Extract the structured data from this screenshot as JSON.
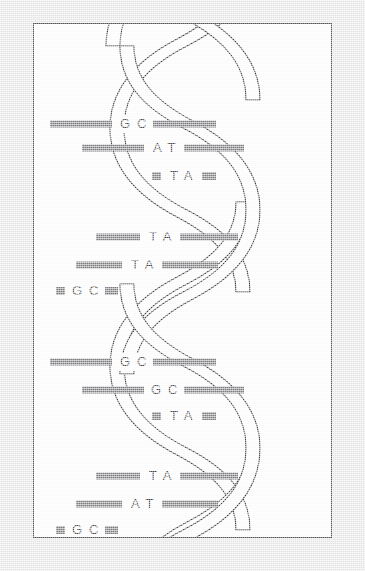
{
  "figure": {
    "name": "dna-double-helix",
    "title": "DNA Double Helix",
    "background_color": "#e9e9e9",
    "frame_color": "#58585c",
    "frame_fill": "#ffffff",
    "strand_stroke_color": "#3d3d42",
    "rung_color": "#7e7e82",
    "label_color": "#4a4a4e"
  },
  "helix": {
    "turns": 4,
    "base_pairs_per_turn": 3,
    "total_base_pairs": 12,
    "left_edge_x": 113,
    "right_edge_x": 256,
    "turn_height": 118
  },
  "base_pairs": [
    {
      "id": "bp-1",
      "turn": 1,
      "index": 1,
      "label": "G C",
      "left_base": "G",
      "right_base": "C",
      "cy": 100,
      "bar_left_x": 16,
      "bar_left_w": 62,
      "bar_right_x": 119,
      "bar_right_w": 63,
      "label_x": 100
    },
    {
      "id": "bp-2",
      "turn": 1,
      "index": 2,
      "label": "A T",
      "left_base": "A",
      "right_base": "T",
      "cy": 124,
      "bar_left_x": 48,
      "bar_left_w": 62,
      "bar_right_x": 150,
      "bar_right_w": 60,
      "label_x": 131
    },
    {
      "id": "bp-3",
      "turn": 1,
      "index": 3,
      "label": "T A",
      "left_base": "T",
      "right_base": "A",
      "cy": 152,
      "bar_left_x": 118,
      "bar_left_w": 9,
      "bar_right_x": 168,
      "bar_right_w": 14,
      "label_x": 148
    },
    {
      "id": "bp-4",
      "turn": 2,
      "index": 1,
      "label": "T A",
      "left_base": "T",
      "right_base": "A",
      "cy": 213,
      "bar_left_x": 62,
      "bar_left_w": 44,
      "bar_right_x": 146,
      "bar_right_w": 58,
      "label_x": 127
    },
    {
      "id": "bp-5",
      "turn": 2,
      "index": 2,
      "label": "T A",
      "left_base": "T",
      "right_base": "A",
      "cy": 241,
      "bar_left_x": 42,
      "bar_left_w": 46,
      "bar_right_x": 128,
      "bar_right_w": 56,
      "label_x": 109
    },
    {
      "id": "bp-6",
      "turn": 2,
      "index": 3,
      "label": "G C",
      "left_base": "G",
      "right_base": "C",
      "cy": 267,
      "bar_left_x": 22,
      "bar_left_w": 9,
      "bar_right_x": 71,
      "bar_right_w": 13,
      "label_x": 52
    },
    {
      "id": "bp-7",
      "turn": 3,
      "index": 1,
      "label": "G C",
      "left_base": "G",
      "right_base": "C",
      "cy": 338,
      "bar_left_x": 16,
      "bar_left_w": 62,
      "bar_right_x": 119,
      "bar_right_w": 63,
      "label_x": 100
    },
    {
      "id": "bp-8",
      "turn": 3,
      "index": 2,
      "label": "G C",
      "left_base": "G",
      "right_base": "C",
      "cy": 366,
      "bar_left_x": 48,
      "bar_left_w": 62,
      "bar_right_x": 150,
      "bar_right_w": 60,
      "label_x": 131
    },
    {
      "id": "bp-9",
      "turn": 3,
      "index": 3,
      "label": "T A",
      "left_base": "T",
      "right_base": "A",
      "cy": 392,
      "bar_left_x": 118,
      "bar_left_w": 9,
      "bar_right_x": 168,
      "bar_right_w": 14,
      "label_x": 148
    },
    {
      "id": "bp-10",
      "turn": 4,
      "index": 1,
      "label": "T A",
      "left_base": "T",
      "right_base": "A",
      "cy": 452,
      "bar_left_x": 62,
      "bar_left_w": 44,
      "bar_right_x": 146,
      "bar_right_w": 58,
      "label_x": 127
    },
    {
      "id": "bp-11",
      "turn": 4,
      "index": 2,
      "label": "A T",
      "left_base": "A",
      "right_base": "T",
      "cy": 480,
      "bar_left_x": 42,
      "bar_left_w": 46,
      "bar_right_x": 128,
      "bar_right_w": 56,
      "label_x": 109
    },
    {
      "id": "bp-12",
      "turn": 4,
      "index": 3,
      "label": "G C",
      "left_base": "G",
      "right_base": "C",
      "cy": 506,
      "bar_left_x": 22,
      "bar_left_w": 9,
      "bar_right_x": 71,
      "bar_right_w": 13,
      "label_x": 52
    }
  ]
}
